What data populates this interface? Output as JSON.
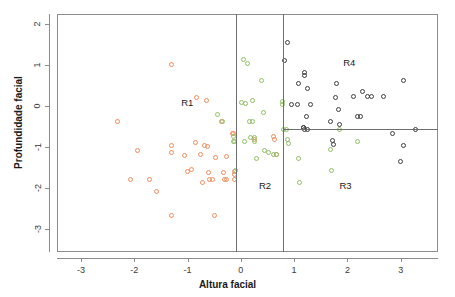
{
  "chart_data": {
    "type": "scatter",
    "title": "",
    "xlabel": "Altura facial",
    "ylabel": "Profundidade facial",
    "xlim": [
      -3.45,
      3.7
    ],
    "ylim": [
      -3.55,
      2.25
    ],
    "xticks": [
      -3,
      -2,
      -1,
      0,
      1,
      2,
      3
    ],
    "xticklabels": [
      "-3",
      "-2",
      "-1",
      "0",
      "1",
      "2",
      "3"
    ],
    "yticks": [
      2,
      1,
      0,
      -1,
      -2,
      -3
    ],
    "yticklabels": [
      "2",
      "1",
      "0",
      "-1",
      "-2",
      "-3"
    ],
    "grid": false,
    "legend": null,
    "colors": {
      "group_orange": "#f08c5a",
      "group_green": "#8fbf62",
      "group_black": "#3d3d3d",
      "frame": "#8c8c8c",
      "split_line": "#6e6e6e"
    },
    "splits": {
      "vertical": [
        -0.09,
        0.8
      ],
      "horizontal": [
        {
          "y": -0.55,
          "x_from": 0.8,
          "x_to": 3.7
        }
      ]
    },
    "annotations": [
      {
        "text": "R1",
        "x": -1.12,
        "y": 0.08
      },
      {
        "text": "R2",
        "x": 0.34,
        "y": -1.94
      },
      {
        "text": "R3",
        "x": 1.85,
        "y": -1.94
      },
      {
        "text": "R4",
        "x": 1.92,
        "y": 1.05
      }
    ],
    "series": [
      {
        "name": "group_orange",
        "color": "#f08c5a",
        "points": [
          [
            -2.31,
            -0.38
          ],
          [
            -1.93,
            -1.08
          ],
          [
            -2.08,
            -1.79
          ],
          [
            -1.72,
            -1.79
          ],
          [
            -1.58,
            -2.07
          ],
          [
            -1.3,
            1.03
          ],
          [
            -1.31,
            -0.95
          ],
          [
            -1.31,
            -1.12
          ],
          [
            -1.3,
            -2.67
          ],
          [
            -1.0,
            -1.58
          ],
          [
            -0.92,
            -1.53
          ],
          [
            -0.84,
            0.21
          ],
          [
            -0.86,
            -0.88
          ],
          [
            -0.75,
            -1.17
          ],
          [
            -0.72,
            -1.86
          ],
          [
            -0.65,
            0.14
          ],
          [
            -0.68,
            -0.96
          ],
          [
            -0.62,
            -0.97
          ],
          [
            -0.6,
            -1.62
          ],
          [
            -0.58,
            -1.78
          ],
          [
            -0.53,
            -1.78
          ],
          [
            -0.5,
            -2.67
          ],
          [
            -0.47,
            -1.24
          ],
          [
            -0.36,
            -0.38
          ],
          [
            -0.33,
            -1.61
          ],
          [
            -0.3,
            -1.78
          ],
          [
            -0.26,
            -1.78
          ],
          [
            -0.26,
            -1.23
          ],
          [
            -0.16,
            -0.67
          ],
          [
            -0.13,
            -0.66
          ],
          [
            -0.12,
            -1.58
          ],
          [
            -0.12,
            -1.66
          ],
          [
            -0.12,
            -1.78
          ],
          [
            0.26,
            -0.8
          ],
          [
            0.62,
            -0.73
          ],
          [
            0.64,
            -0.81
          ],
          [
            0.66,
            -1.17
          ],
          [
            -1.06,
            -1.2
          ]
        ]
      },
      {
        "name": "group_green",
        "color": "#8fbf62",
        "points": [
          [
            -0.44,
            -0.2
          ],
          [
            -0.35,
            -0.37
          ],
          [
            -0.14,
            -0.74
          ],
          [
            -0.13,
            -0.85
          ],
          [
            -0.11,
            -0.86
          ],
          [
            -0.1,
            -1.56
          ],
          [
            0.05,
            1.14
          ],
          [
            0.13,
            1.05
          ],
          [
            0.02,
            0.1
          ],
          [
            0.08,
            0.06
          ],
          [
            0.22,
            0.13
          ],
          [
            0.38,
            0.64
          ],
          [
            0.43,
            -0.16
          ],
          [
            0.17,
            -0.37
          ],
          [
            0.21,
            -0.36
          ],
          [
            0.19,
            -0.76
          ],
          [
            0.26,
            -0.86
          ],
          [
            0.3,
            -1.26
          ],
          [
            0.45,
            -1.07
          ],
          [
            0.51,
            -1.12
          ],
          [
            0.62,
            -1.17
          ],
          [
            0.67,
            -1.18
          ],
          [
            0.78,
            0.12
          ],
          [
            0.79,
            0.04
          ],
          [
            0.8,
            -0.56
          ],
          [
            0.85,
            -0.56
          ],
          [
            0.88,
            -0.8
          ],
          [
            0.9,
            -0.9
          ],
          [
            1.08,
            -1.26
          ],
          [
            1.1,
            -1.85
          ],
          [
            1.68,
            -1.04
          ],
          [
            1.7,
            -1.56
          ],
          [
            1.85,
            -0.57
          ],
          [
            2.18,
            -0.86
          ],
          [
            0.26,
            -0.76
          ],
          [
            0.06,
            -0.86
          ]
        ]
      },
      {
        "name": "group_black",
        "color": "#3d3d3d",
        "points": [
          [
            0.88,
            1.55
          ],
          [
            0.81,
            1.12
          ],
          [
            1.2,
            0.83
          ],
          [
            1.2,
            0.74
          ],
          [
            1.08,
            0.55
          ],
          [
            1.25,
            0.44
          ],
          [
            0.96,
            0.04
          ],
          [
            1.06,
            0.04
          ],
          [
            1.3,
            0.04
          ],
          [
            1.23,
            -0.26
          ],
          [
            1.18,
            -0.52
          ],
          [
            1.2,
            -0.56
          ],
          [
            1.25,
            -0.56
          ],
          [
            1.68,
            -0.36
          ],
          [
            1.72,
            -0.84
          ],
          [
            1.74,
            -0.93
          ],
          [
            1.79,
            0.55
          ],
          [
            1.78,
            0.21
          ],
          [
            1.83,
            -0.08
          ],
          [
            1.85,
            -0.45
          ],
          [
            2.12,
            0.24
          ],
          [
            2.18,
            -0.25
          ],
          [
            2.24,
            -0.25
          ],
          [
            2.29,
            0.35
          ],
          [
            2.38,
            0.23
          ],
          [
            2.46,
            0.23
          ],
          [
            2.68,
            0.23
          ],
          [
            2.85,
            -0.66
          ],
          [
            3.05,
            0.64
          ],
          [
            3.06,
            -0.96
          ],
          [
            3.0,
            -1.35
          ],
          [
            3.28,
            -0.56
          ],
          [
            1.17,
            -0.52
          ]
        ]
      }
    ]
  }
}
